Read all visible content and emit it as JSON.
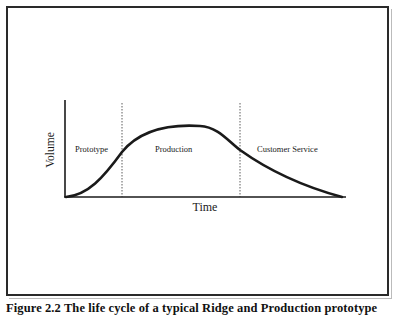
{
  "figure": {
    "caption": "Figure 2.2 The life cycle of a typical Ridge and Production prototype"
  },
  "diagram": {
    "axes": {
      "x_label": "Time",
      "y_label": "Volume"
    },
    "phases": [
      {
        "label": "Prototype"
      },
      {
        "label": "Production"
      },
      {
        "label": "Customer Service"
      }
    ],
    "colors": {
      "line": "#1a1a1a",
      "frame": "#2a2a2a",
      "background": "#ffffff"
    }
  }
}
